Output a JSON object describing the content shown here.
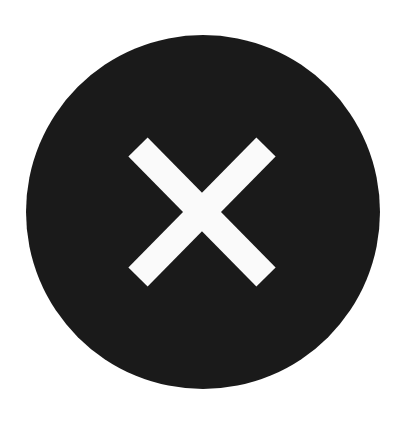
{
  "icon": {
    "name": "close-circle-icon",
    "description": "Black filled circle with white X",
    "colors": {
      "circle": "#1a1a1a",
      "cross": "#fafafa",
      "background": "#ffffff"
    }
  }
}
